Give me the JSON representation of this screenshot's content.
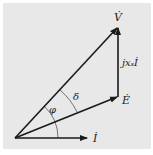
{
  "diagram": {
    "type": "phasor-diagram",
    "background": "#e8e8e8",
    "line_color": "#1a1a1a",
    "vectors": [
      {
        "name": "V",
        "label": "V̇",
        "from": [
          15,
          138
        ],
        "to": [
          118,
          27
        ]
      },
      {
        "name": "E",
        "label": "Ė",
        "from": [
          15,
          138
        ],
        "to": [
          118,
          97
        ]
      },
      {
        "name": "I",
        "label": "İ",
        "from": [
          15,
          138
        ],
        "to": [
          87,
          138
        ]
      },
      {
        "name": "jxsI",
        "label": "jxₛİ",
        "from": [
          118,
          97
        ],
        "to": [
          118,
          27
        ]
      }
    ],
    "angles": [
      {
        "symbol": "φ",
        "between": [
          "I",
          "V"
        ]
      },
      {
        "symbol": "δ",
        "between": [
          "E",
          "V"
        ]
      }
    ]
  }
}
